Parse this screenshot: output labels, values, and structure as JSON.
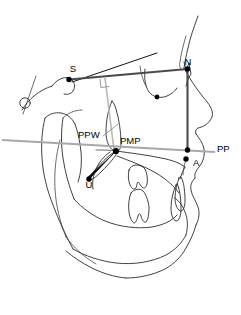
{
  "figure": {
    "kind": "cephalometric-tracing",
    "width": 241,
    "height": 315,
    "background": "#ffffff"
  },
  "colors": {
    "outline": "#2b2b2b",
    "measurement_dark": "#4a4a4a",
    "measurement_black": "#111111",
    "measurement_gray": "#a8a8a8",
    "palatal_plane": "#b9b9b9",
    "landmark_dot": "#000000",
    "label_text": "#000000"
  },
  "labels": [
    {
      "id": "S",
      "text": "S",
      "x": 73,
      "y": 72,
      "anchor": "middle",
      "size": "lbl"
    },
    {
      "id": "N",
      "text": "N",
      "x": 188,
      "y": 65,
      "anchor": "middle",
      "size": "lbl"
    },
    {
      "id": "PPW",
      "text": "PPW",
      "x": 78,
      "y": 138,
      "anchor": "start",
      "size": "lbl"
    },
    {
      "id": "PMP",
      "text": "PMP",
      "x": 120,
      "y": 144,
      "anchor": "start",
      "size": "lbl"
    },
    {
      "id": "PP",
      "text": "PP",
      "x": 217,
      "y": 152,
      "anchor": "start",
      "size": "lbl"
    },
    {
      "id": "A",
      "text": "A",
      "x": 193,
      "y": 166,
      "anchor": "start",
      "size": "lbl"
    },
    {
      "id": "U",
      "text": "U",
      "x": 89,
      "y": 188,
      "anchor": "middle",
      "size": "lbl"
    }
  ],
  "landmarks": [
    {
      "id": "S",
      "name": "sella",
      "x": 69,
      "y": 79.5,
      "r": 2.6
    },
    {
      "id": "N",
      "name": "nasion",
      "x": 187.5,
      "y": 69,
      "r": 2.6
    },
    {
      "id": "PMP",
      "name": "posterior-maxillary-point",
      "x": 116,
      "y": 151,
      "r": 3.0
    },
    {
      "id": "U",
      "name": "uvula-tip",
      "x": 89,
      "y": 179,
      "r": 2.6
    },
    {
      "id": "PPline",
      "name": "pp-intersection",
      "x": 187.5,
      "y": 150,
      "r": 2.6
    },
    {
      "id": "A",
      "name": "a-point",
      "x": 186,
      "y": 159,
      "r": 2.6
    },
    {
      "id": "clivus",
      "name": "clivus-dot",
      "x": 157,
      "y": 97,
      "r": 2.4
    }
  ],
  "measurement_lines": [
    {
      "id": "sn-plane",
      "name": "sella-nasion-plane",
      "from": "S",
      "to": "N",
      "style": "measurement_dark"
    },
    {
      "id": "n-a-vertical",
      "name": "nasion-a-vertical",
      "from": "N",
      "to": "A",
      "style": "measurement_dark"
    },
    {
      "id": "pp-plane",
      "name": "palatal-plane",
      "from": "PMP",
      "to": "PP",
      "style": "palatal_plane"
    },
    {
      "id": "pmp-u",
      "name": "soft-palate-length",
      "from": "PMP",
      "to": "U",
      "style": "measurement_black"
    },
    {
      "id": "ppw-leader",
      "name": "ppw-leader-line",
      "from": "PPW",
      "to": "PMP",
      "style": "measurement_gray"
    },
    {
      "id": "s-perp",
      "name": "perpendicular-from-sn",
      "from": "S-perp",
      "to": "PMP",
      "style": "palatal_plane"
    }
  ],
  "annotations": {
    "right_angle_marker": {
      "name": "right-angle-symbol",
      "x": 101,
      "y": 80,
      "size": 8
    }
  }
}
